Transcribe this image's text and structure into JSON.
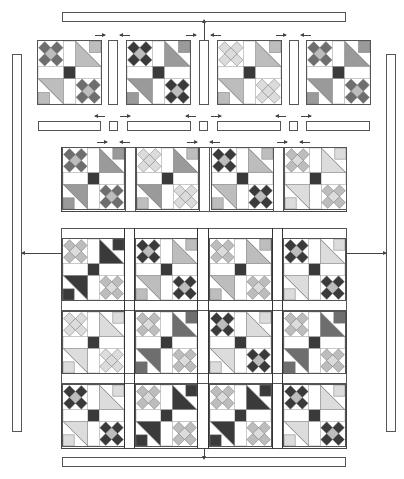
{
  "diagram": {
    "type": "quilt-assembly-diagram",
    "palette": {
      "dark": "#3a3a3a",
      "medium_dark": "#6e6e6e",
      "medium": "#9a9a9a",
      "light": "#bdbdbd",
      "pale": "#dcdcdc",
      "outline": "#555555",
      "background": "#ffffff"
    },
    "border_strips": {
      "top": {
        "x": 62,
        "y": 12,
        "w": 284,
        "h": 10
      },
      "bottom": {
        "x": 62,
        "y": 457,
        "w": 284,
        "h": 10
      },
      "left": {
        "x": 12,
        "y": 54,
        "w": 10,
        "h": 378
      },
      "right": {
        "x": 386,
        "y": 54,
        "w": 10,
        "h": 378
      }
    },
    "row1": {
      "description": "Four blocks separated by vertical sashing strips",
      "blocks": [
        {
          "x": 37,
          "star": "medium_dark",
          "tri": "light",
          "corner": "light"
        },
        {
          "x": 126,
          "star": "dark",
          "tri": "medium",
          "corner": "medium"
        },
        {
          "x": 217,
          "star": "pale",
          "tri": "light",
          "corner": "light"
        },
        {
          "x": 306,
          "star": "medium_dark",
          "tri": "medium",
          "corner": "medium"
        }
      ],
      "sashes": [
        108,
        199,
        289
      ]
    },
    "sashing_row": {
      "description": "Horizontal sashing strips with cornerstones",
      "long_strips": [
        {
          "x": 38,
          "w": 63
        },
        {
          "x": 127,
          "w": 64
        },
        {
          "x": 217,
          "w": 64
        },
        {
          "x": 306,
          "w": 64
        }
      ],
      "cornerstones": [
        {
          "x": 109
        },
        {
          "x": 199
        },
        {
          "x": 289
        }
      ]
    },
    "row2_panel": {
      "description": "Joined row of four blocks",
      "blocks": [
        {
          "star": "medium_dark",
          "tri": "medium",
          "corner": "medium"
        },
        {
          "star": "pale",
          "tri": "medium",
          "corner": "light"
        },
        {
          "star": "dark",
          "tri": "light",
          "corner": "light"
        },
        {
          "star": "light",
          "tri": "pale",
          "corner": "pale"
        }
      ]
    },
    "lower_panel": {
      "description": "Assembled quilt center, 3 rows × 4 columns with sashing",
      "rows": [
        [
          {
            "star": "light",
            "tri": "dark",
            "corner": "dark"
          },
          {
            "star": "dark",
            "tri": "light",
            "corner": "light"
          },
          {
            "star": "light",
            "tri": "light",
            "corner": "light"
          },
          {
            "star": "dark",
            "tri": "pale",
            "corner": "pale"
          }
        ],
        [
          {
            "star": "pale",
            "tri": "pale",
            "corner": "pale"
          },
          {
            "star": "light",
            "tri": "medium_dark",
            "corner": "medium_dark"
          },
          {
            "star": "dark",
            "tri": "pale",
            "corner": "pale"
          },
          {
            "star": "light",
            "tri": "medium_dark",
            "corner": "medium_dark"
          }
        ],
        [
          {
            "star": "dark",
            "tri": "pale",
            "corner": "pale"
          },
          {
            "star": "light",
            "tri": "dark",
            "corner": "dark"
          },
          {
            "star": "light",
            "tri": "dark",
            "corner": "dark"
          },
          {
            "star": "dark",
            "tri": "pale",
            "corner": "pale"
          }
        ]
      ]
    },
    "labels": []
  }
}
